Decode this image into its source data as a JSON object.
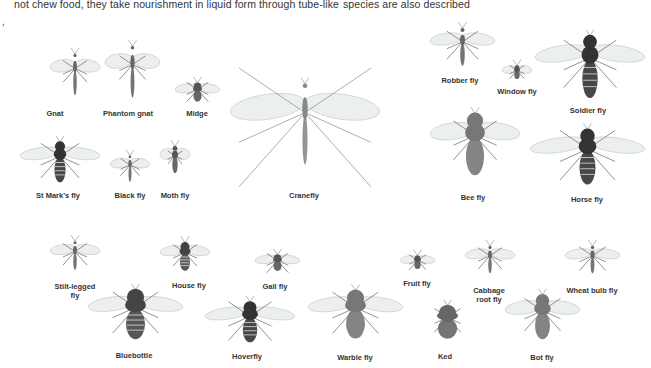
{
  "page": {
    "text_fragments": {
      "left_column": "not chew food, they take nourishment in liquid form through tube-like",
      "right_column": "species are also described",
      "stray_mark": ","
    }
  },
  "insects": [
    {
      "id": "gnat",
      "label": "Gnat",
      "x": 50,
      "y": 45,
      "w": 50,
      "h": 60,
      "kind": "slender",
      "lx": 55,
      "ly": 109
    },
    {
      "id": "phantom-gnat",
      "label": "Phantom gnat",
      "x": 105,
      "y": 35,
      "w": 55,
      "h": 75,
      "kind": "slender",
      "lx": 128,
      "ly": 109
    },
    {
      "id": "midge",
      "label": "Midge",
      "x": 175,
      "y": 75,
      "w": 45,
      "h": 35,
      "kind": "small",
      "lx": 197,
      "ly": 109
    },
    {
      "id": "st-marks-fly",
      "label": "St Mark's fly",
      "x": 20,
      "y": 135,
      "w": 80,
      "h": 55,
      "kind": "dark",
      "lx": 58,
      "ly": 191
    },
    {
      "id": "black-fly",
      "label": "Black fly",
      "x": 110,
      "y": 150,
      "w": 40,
      "h": 38,
      "kind": "slender",
      "lx": 130,
      "ly": 191
    },
    {
      "id": "moth-fly",
      "label": "Moth fly",
      "x": 160,
      "y": 135,
      "w": 30,
      "h": 50,
      "kind": "small",
      "lx": 175,
      "ly": 191
    },
    {
      "id": "cranefly",
      "label": "Cranefly",
      "x": 230,
      "y": 50,
      "w": 150,
      "h": 150,
      "kind": "crane",
      "lx": 304,
      "ly": 191
    },
    {
      "id": "robber-fly",
      "label": "Robber fly",
      "x": 430,
      "y": 20,
      "w": 65,
      "h": 55,
      "kind": "slender",
      "lx": 460,
      "ly": 76
    },
    {
      "id": "window-fly",
      "label": "Window fly",
      "x": 502,
      "y": 60,
      "w": 30,
      "h": 25,
      "kind": "small",
      "lx": 517,
      "ly": 87
    },
    {
      "id": "soldier-fly",
      "label": "Soldier fly",
      "x": 535,
      "y": 25,
      "w": 110,
      "h": 85,
      "kind": "dark",
      "lx": 588,
      "ly": 106
    },
    {
      "id": "bee-fly",
      "label": "Bee fly",
      "x": 430,
      "y": 100,
      "w": 90,
      "h": 90,
      "kind": "hairy",
      "lx": 473,
      "ly": 193
    },
    {
      "id": "horse-fly",
      "label": "Horse fly",
      "x": 530,
      "y": 120,
      "w": 115,
      "h": 75,
      "kind": "dark",
      "lx": 587,
      "ly": 195
    },
    {
      "id": "stilt-legged-fly",
      "label": "Stilt-legged\nfly",
      "x": 50,
      "y": 235,
      "w": 50,
      "h": 42,
      "kind": "slender",
      "lx": 75,
      "ly": 282
    },
    {
      "id": "house-fly",
      "label": "House fly",
      "x": 160,
      "y": 237,
      "w": 50,
      "h": 40,
      "kind": "fly",
      "lx": 189,
      "ly": 281
    },
    {
      "id": "bluebottle",
      "label": "Bluebottle",
      "x": 88,
      "y": 280,
      "w": 95,
      "h": 70,
      "kind": "fly",
      "lx": 134,
      "ly": 351
    },
    {
      "id": "gall-fly",
      "label": "Gall fly",
      "x": 255,
      "y": 248,
      "w": 45,
      "h": 30,
      "kind": "small",
      "lx": 275,
      "ly": 282
    },
    {
      "id": "hoverfly",
      "label": "Hoverfly",
      "x": 205,
      "y": 295,
      "w": 90,
      "h": 55,
      "kind": "striped",
      "lx": 247,
      "ly": 352
    },
    {
      "id": "warble-fly",
      "label": "Warble fly",
      "x": 308,
      "y": 280,
      "w": 95,
      "h": 70,
      "kind": "hairy",
      "lx": 355,
      "ly": 353
    },
    {
      "id": "fruit-fly",
      "label": "Fruit fly",
      "x": 400,
      "y": 250,
      "w": 35,
      "h": 25,
      "kind": "small",
      "lx": 417,
      "ly": 279
    },
    {
      "id": "cabbage-root-fly",
      "label": "Cabbage\nroot fly",
      "x": 465,
      "y": 240,
      "w": 50,
      "h": 40,
      "kind": "slender",
      "lx": 489,
      "ly": 286
    },
    {
      "id": "ked",
      "label": "Ked",
      "x": 420,
      "y": 300,
      "w": 55,
      "h": 45,
      "kind": "ked",
      "lx": 445,
      "ly": 352
    },
    {
      "id": "bot-fly",
      "label": "Bot fly",
      "x": 505,
      "y": 285,
      "w": 75,
      "h": 65,
      "kind": "hairy",
      "lx": 542,
      "ly": 353
    },
    {
      "id": "wheat-bulb-fly",
      "label": "Wheat bulb fly",
      "x": 565,
      "y": 240,
      "w": 55,
      "h": 40,
      "kind": "slender",
      "lx": 592,
      "ly": 286
    }
  ]
}
